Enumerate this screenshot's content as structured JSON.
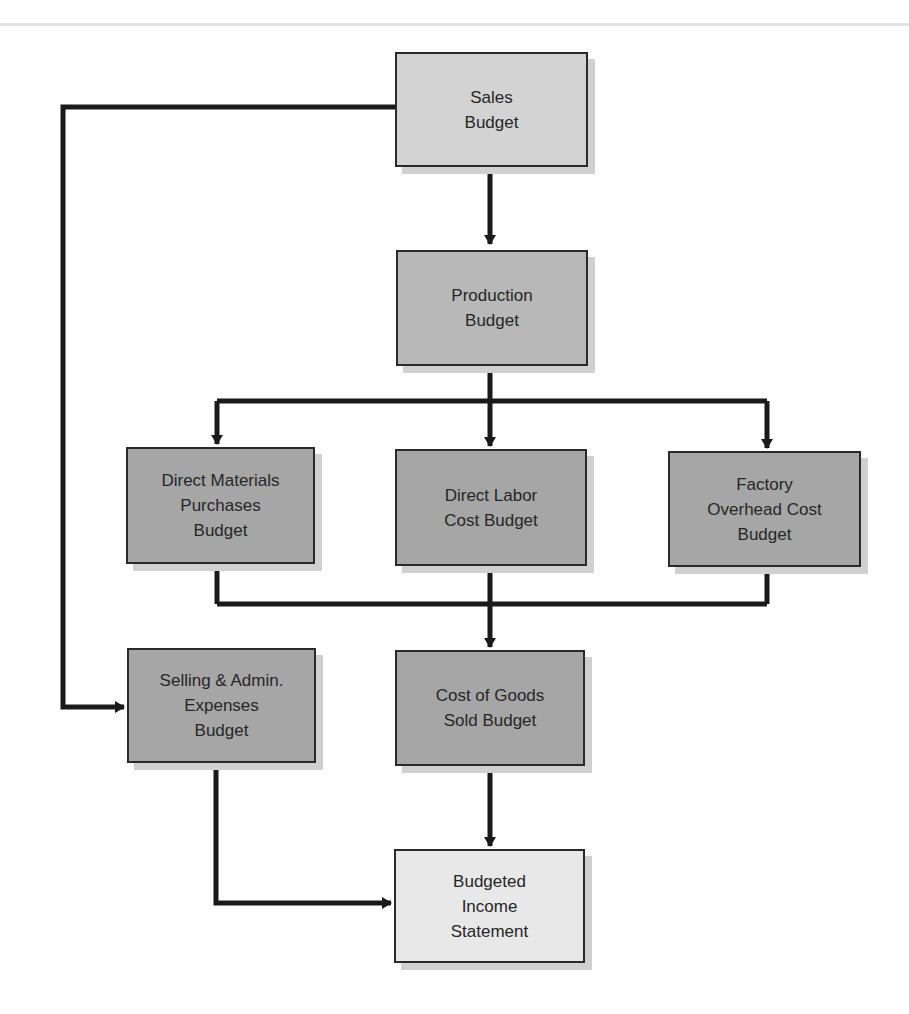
{
  "diagram": {
    "type": "flowchart",
    "nodes": [
      {
        "id": "sales",
        "label": "Sales\nBudget"
      },
      {
        "id": "production",
        "label": "Production\nBudget"
      },
      {
        "id": "direct_materials",
        "label": "Direct Materials\nPurchases\nBudget"
      },
      {
        "id": "direct_labor",
        "label": "Direct Labor\nCost Budget"
      },
      {
        "id": "factory_overhead",
        "label": "Factory\nOverhead Cost\nBudget"
      },
      {
        "id": "selling_admin",
        "label": "Selling & Admin.\nExpenses\nBudget"
      },
      {
        "id": "cogs",
        "label": "Cost of Goods\nSold Budget"
      },
      {
        "id": "income_statement",
        "label": "Budgeted\nIncome\nStatement"
      }
    ],
    "edges": [
      {
        "from": "sales",
        "to": "production"
      },
      {
        "from": "sales",
        "to": "selling_admin"
      },
      {
        "from": "production",
        "to": "direct_materials"
      },
      {
        "from": "production",
        "to": "direct_labor"
      },
      {
        "from": "production",
        "to": "factory_overhead"
      },
      {
        "from": "direct_materials",
        "to": "cogs"
      },
      {
        "from": "direct_labor",
        "to": "cogs"
      },
      {
        "from": "factory_overhead",
        "to": "cogs"
      },
      {
        "from": "cogs",
        "to": "income_statement"
      },
      {
        "from": "selling_admin",
        "to": "income_statement"
      }
    ],
    "colors": {
      "line": "#1a1a1a",
      "box_border": "#2a2a2a",
      "sales_fill": "#d3d3d3",
      "production_fill": "#b8b8b8",
      "operating_fill": "#a6a6a6",
      "income_fill": "#e8e8e8",
      "shadow": "#d0d0d0"
    }
  }
}
